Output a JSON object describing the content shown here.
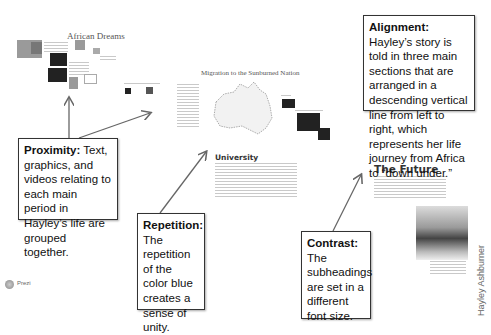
{
  "prezi_canvas": {
    "section_titles": {
      "africa": "African Dreams",
      "migration": "Migration to the Sunburned Nation",
      "university": "University",
      "future": "The Future"
    },
    "logo_label": "Prezi",
    "author_credit": "Hayley Ashburner"
  },
  "callouts": {
    "alignment": {
      "term": "Alignment:",
      "text": " Hayley’s story is told in three main sections that are arranged in a descending vertical line from left to right, which represents her life journey from Africa to “down under.”"
    },
    "proximity": {
      "term": "Proximity:",
      "text": " Text, graphics, and videos relating to each main period in Hayley’s life are grouped together."
    },
    "repetition": {
      "term": "Repetition:",
      "text": " The repetition of the color blue creates a sense of unity."
    },
    "contrast": {
      "term": "Contrast:",
      "text": " The subheadings are set in a different font size."
    }
  },
  "colors": {
    "callout_border": "#333333",
    "arrow": "#666666",
    "background": "#ffffff"
  }
}
